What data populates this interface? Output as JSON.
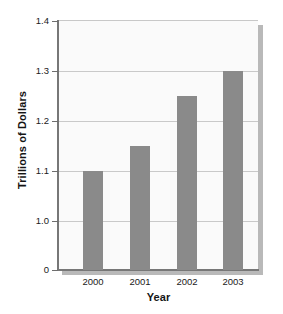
{
  "chart_data": {
    "type": "bar",
    "title": "",
    "xlabel": "Year",
    "ylabel": "Trillions of Dollars",
    "categories": [
      "2000",
      "2001",
      "2002",
      "2003"
    ],
    "values": [
      1.1,
      1.15,
      1.25,
      1.3
    ],
    "series": [
      {
        "name": "Trillions of Dollars",
        "values": [
          1.1,
          1.15,
          1.25,
          1.3
        ]
      }
    ],
    "ylim": [
      1.0,
      1.4
    ],
    "broken_axis": true,
    "zero_tick_shown": true,
    "y_ticks": [
      "0",
      "1.0",
      "1.1",
      "1.2",
      "1.3",
      "1.4"
    ],
    "y_tick_values": [
      0,
      1.0,
      1.1,
      1.2,
      1.3,
      1.4
    ],
    "x_ticks": [
      "2000",
      "2001",
      "2002",
      "2003"
    ],
    "grid": true,
    "legend": "none",
    "colors": {
      "bar": "#8a8a8a",
      "panel": "#fafafa",
      "gridline": "#c9c9c9",
      "axis": "#777777",
      "shadow": "#b9b9b9",
      "text": "#1a1a1a"
    }
  },
  "y_axis": {
    "title": "Trillions of Dollars",
    "ticks": [
      {
        "label": "1.4",
        "top": 21
      },
      {
        "label": "1.3",
        "top": 71
      },
      {
        "label": "1.2",
        "top": 121
      },
      {
        "label": "1.1",
        "top": 171
      },
      {
        "label": "1.0",
        "top": 221
      },
      {
        "label": "0",
        "top": 270
      }
    ]
  },
  "x_axis": {
    "title": "Year",
    "ticks": [
      {
        "label": "2000",
        "left": 69
      },
      {
        "label": "2001",
        "left": 116
      },
      {
        "label": "2002",
        "left": 163
      },
      {
        "label": "2003",
        "left": 209
      }
    ]
  },
  "bars": [
    {
      "category": "2000",
      "value": "1.10",
      "left": 83,
      "top": 171,
      "height": 99
    },
    {
      "category": "2001",
      "value": "1.15",
      "left": 130,
      "top": 146,
      "height": 124
    },
    {
      "category": "2002",
      "value": "1.25",
      "left": 177,
      "top": 96,
      "height": 174
    },
    {
      "category": "2003",
      "value": "1.30",
      "left": 223,
      "top": 71,
      "height": 199
    }
  ],
  "gridlines": [
    {
      "top": 70
    },
    {
      "top": 120
    },
    {
      "top": 170
    },
    {
      "top": 220
    }
  ]
}
